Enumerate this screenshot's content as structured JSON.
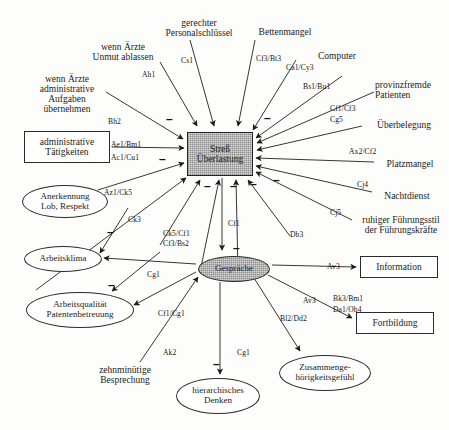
{
  "diagram": {
    "type": "causal-network-diagram",
    "colors": {
      "background": "#fdfdfc",
      "stroke": "#1f1f1f",
      "central_node_fill": "#d9d9d9",
      "gespraeche_fill": "#d5d5d5",
      "box_fill": "#ffffff"
    }
  },
  "nodes": [
    {
      "id": "stress",
      "label": "Streß\nÜberlastung",
      "line1": "Streß",
      "line2": "Überlastung",
      "shape": "rect-shaded",
      "x": 187,
      "y": 132,
      "w": 66,
      "h": 44
    },
    {
      "id": "gespraeche",
      "label": "Gespräche",
      "line1": "Gespräche",
      "line2": "",
      "shape": "ellipse-shaded",
      "x": 198,
      "y": 256,
      "w": 72,
      "h": 26
    },
    {
      "id": "administrative",
      "label": "administrative\nTätigkeiten",
      "line1": "administrative",
      "line2": "Tätigkeiten",
      "shape": "rect",
      "x": 24,
      "y": 131,
      "w": 86,
      "h": 32
    },
    {
      "id": "information",
      "label": "Information",
      "line1": "Information",
      "line2": "",
      "shape": "rect",
      "x": 360,
      "y": 256,
      "w": 78,
      "h": 22
    },
    {
      "id": "fortbildung",
      "label": "Fortbildung",
      "line1": "Fortbildung",
      "line2": "",
      "shape": "rect",
      "x": 356,
      "y": 312,
      "w": 78,
      "h": 22
    },
    {
      "id": "anerkennung",
      "label": "Anerkennung\nLob, Respekt",
      "line1": "Anerkennung",
      "line2": "Lob, Respekt",
      "shape": "ellipse",
      "x": 22,
      "y": 185,
      "w": 86,
      "h": 33
    },
    {
      "id": "arbeitsklima",
      "label": "Arbeitsklima",
      "line1": "Arbeitsklima",
      "line2": "",
      "shape": "ellipse",
      "x": 24,
      "y": 246,
      "w": 78,
      "h": 26
    },
    {
      "id": "arbeitsqualitaet",
      "label": "Arbeitsqualität\nPatentenbetreuung",
      "line1": "Arbeitsqualität",
      "line2": "Patentenbetreuung",
      "shape": "ellipse",
      "x": 26,
      "y": 292,
      "w": 108,
      "h": 36
    },
    {
      "id": "hierarchisches",
      "label": "hierarchisches\nDenken",
      "line1": "hierarchisches",
      "line2": "Denken",
      "shape": "ellipse",
      "x": 176,
      "y": 378,
      "w": 84,
      "h": 36
    },
    {
      "id": "zusammengehoerig",
      "label": "Zusammenge-\nhörigkeitsgefühl",
      "line1": "Zusammenge-",
      "line2": "hörigkeitsgefühl",
      "shape": "ellipse",
      "x": 279,
      "y": 355,
      "w": 92,
      "h": 36
    },
    {
      "id": "wenn_aerzte_unmut",
      "label": "wenn Ärzte\nUnmut ablassen",
      "line1": "wenn Ärzte",
      "line2": "Unmut ablassen",
      "shape": "plain",
      "x": 79,
      "y": 40,
      "w": 88,
      "h": 24
    },
    {
      "id": "wenn_aerzte_admin",
      "label": "wenn Ärzte\nadministrative\nAufgaben\nübernehmen",
      "line1": "wenn Ärzte",
      "line2": "administrative",
      "line3": "Aufgaben",
      "line4": "übernehmen",
      "shape": "plain",
      "x": 28,
      "y": 72,
      "w": 78,
      "h": 44
    },
    {
      "id": "gerechter",
      "label": "gerechter\nPersonalschlüssel",
      "line1": "gerechter",
      "line2": "Personalschlüssel",
      "shape": "plain",
      "x": 150,
      "y": 16,
      "w": 92,
      "h": 24
    },
    {
      "id": "bettenmangel",
      "label": "Bettenmangel",
      "line1": "Bettenmangel",
      "line2": "",
      "shape": "plain",
      "x": 250,
      "y": 26,
      "w": 70,
      "h": 12
    },
    {
      "id": "computer",
      "label": "Computer",
      "line1": "Computer",
      "line2": "",
      "shape": "plain",
      "x": 311,
      "y": 50,
      "w": 52,
      "h": 12
    },
    {
      "id": "provinzfremde",
      "label": "provinzfremde\nPatienten",
      "line1": "provinzfremde",
      "line2": "Patienten",
      "shape": "plain",
      "x": 377,
      "y": 78,
      "w": 72,
      "h": 24
    },
    {
      "id": "ueberbelegung",
      "label": "Überbelegung",
      "line1": "Überbelegung",
      "line2": "",
      "shape": "plain",
      "x": 366,
      "y": 119,
      "w": 72,
      "h": 12
    },
    {
      "id": "platzmangel",
      "label": "Platzmangel",
      "line1": "Platzmangel",
      "line2": "",
      "shape": "plain",
      "x": 378,
      "y": 158,
      "w": 64,
      "h": 12
    },
    {
      "id": "nachtdienst",
      "label": "Nachtdienst",
      "line1": "Nachtdienst",
      "line2": "",
      "shape": "plain",
      "x": 376,
      "y": 190,
      "w": 62,
      "h": 12
    },
    {
      "id": "ruhiger",
      "label": "ruhiger Führungsstil\nder Führungskräfte",
      "line1": "ruhiger Führungsstil",
      "line2": "der Führungskräfte",
      "shape": "plain",
      "x": 355,
      "y": 215,
      "w": 94,
      "h": 24
    },
    {
      "id": "zehnminuetige",
      "label": "zehnminütige\nBesprechung",
      "line1": "zehnminütige",
      "line2": "Besprechung",
      "shape": "plain",
      "x": 86,
      "y": 363,
      "w": 72,
      "h": 24
    }
  ],
  "edge_labels": [
    {
      "id": "ah1",
      "text": "Ah1",
      "x": 142,
      "y": 70
    },
    {
      "id": "cs1",
      "text": "Cs1",
      "x": 181,
      "y": 56
    },
    {
      "id": "cf3bt3",
      "text": "Cf3/Bt3",
      "x": 256,
      "y": 54
    },
    {
      "id": "ca1cy3",
      "text": "Ca1/Cy3",
      "x": 286,
      "y": 63
    },
    {
      "id": "bs1bu1",
      "text": "Bs1/Bu1",
      "x": 303,
      "y": 82
    },
    {
      "id": "cf1cf3",
      "text": "Cf1/Cf3",
      "x": 330,
      "y": 104
    },
    {
      "id": "cg5",
      "text": "Cg5",
      "x": 330,
      "y": 115
    },
    {
      "id": "bh2",
      "text": "Bh2",
      "x": 108,
      "y": 117
    },
    {
      "id": "ae1bm1",
      "text": "Ae1/Bm1",
      "x": 111,
      "y": 140
    },
    {
      "id": "ac1cu1",
      "text": "Ac1/Cu1",
      "x": 111,
      "y": 153
    },
    {
      "id": "az1ck5",
      "text": "Az1/Ck5",
      "x": 104,
      "y": 188
    },
    {
      "id": "ax2cf2",
      "text": "Ax2/Cf2",
      "x": 349,
      "y": 147
    },
    {
      "id": "cj4",
      "text": "Cj4",
      "x": 357,
      "y": 180
    },
    {
      "id": "cj5",
      "text": "Cj5",
      "x": 330,
      "y": 208
    },
    {
      "id": "ck3",
      "text": "Ck3",
      "x": 128,
      "y": 215
    },
    {
      "id": "ck5cf1",
      "text": "Ck5/Cf1",
      "x": 163,
      "y": 229
    },
    {
      "id": "cf3bs2",
      "text": "Cf3/Bs2",
      "x": 163,
      "y": 239
    },
    {
      "id": "cf1_top",
      "text": "Cf1",
      "x": 228,
      "y": 219
    },
    {
      "id": "db3",
      "text": "Db3",
      "x": 290,
      "y": 230
    },
    {
      "id": "cg1_left",
      "text": "Cg1",
      "x": 147,
      "y": 270
    },
    {
      "id": "cf1cg1",
      "text": "Cf1/Cg1",
      "x": 158,
      "y": 309
    },
    {
      "id": "av3_info",
      "text": "Av3",
      "x": 327,
      "y": 262
    },
    {
      "id": "av3_fort",
      "text": "Av3",
      "x": 303,
      "y": 296
    },
    {
      "id": "bk3bm1",
      "text": "Bk3/Bm1",
      "x": 333,
      "y": 294
    },
    {
      "id": "da1ob4",
      "text": "Da1/Ob4",
      "x": 333,
      "y": 305
    },
    {
      "id": "bl2dd2",
      "text": "Bl2/Dd2",
      "x": 280,
      "y": 314
    },
    {
      "id": "ak2",
      "text": "Ak2",
      "x": 163,
      "y": 348
    },
    {
      "id": "cg1_hier",
      "text": "Cg1",
      "x": 237,
      "y": 348
    }
  ],
  "signs": [
    {
      "id": "sign-1",
      "text": "–",
      "x": 166,
      "y": 116
    },
    {
      "id": "sign-2",
      "text": "–",
      "x": 264,
      "y": 115
    },
    {
      "id": "sign-3",
      "text": "–",
      "x": 159,
      "y": 156
    },
    {
      "id": "sign-4",
      "text": "–",
      "x": 273,
      "y": 177
    },
    {
      "id": "sign-5",
      "text": "–",
      "x": 204,
      "y": 183
    },
    {
      "id": "sign-6",
      "text": "–",
      "x": 230,
      "y": 183
    },
    {
      "id": "sign-7",
      "text": "–",
      "x": 250,
      "y": 181
    },
    {
      "id": "sign-8",
      "text": "–",
      "x": 107,
      "y": 229
    },
    {
      "id": "sign-9",
      "text": "–",
      "x": 108,
      "y": 282
    },
    {
      "id": "sign-10",
      "text": "–",
      "x": 233,
      "y": 245
    },
    {
      "id": "sign-11",
      "text": "–",
      "x": 213,
      "y": 361
    }
  ]
}
